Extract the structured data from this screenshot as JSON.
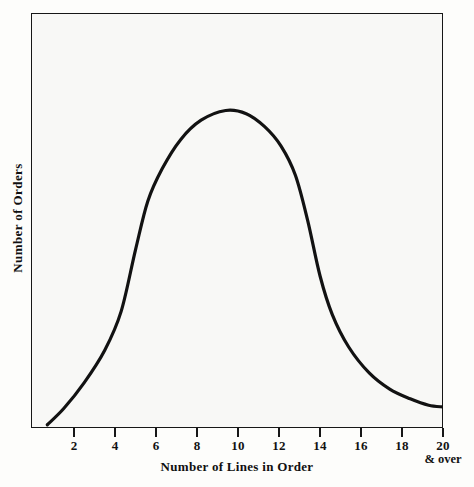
{
  "chart_data": {
    "type": "line",
    "title": "",
    "subtitle": "",
    "xlabel": "Number of Lines in Order",
    "ylabel": "Number of Orders",
    "xlim": [
      0,
      20
    ],
    "ylim": [
      0,
      1
    ],
    "grid": false,
    "legend": null,
    "annotations": [
      {
        "name": "x-axis-over-note",
        "text": "& over",
        "at_x": 20
      }
    ],
    "x_ticks": [
      {
        "value": 2,
        "label": "2"
      },
      {
        "value": 4,
        "label": "4"
      },
      {
        "value": 6,
        "label": "6"
      },
      {
        "value": 8,
        "label": "8"
      },
      {
        "value": 10,
        "label": "10"
      },
      {
        "value": 12,
        "label": "12"
      },
      {
        "value": 14,
        "label": "14"
      },
      {
        "value": 16,
        "label": "16"
      },
      {
        "value": 18,
        "label": "18"
      },
      {
        "value": 20,
        "label": "20"
      }
    ],
    "y_ticks": [],
    "series": [
      {
        "name": "Order line distribution",
        "color": "#121212",
        "line_width": 3,
        "x": [
          0.7,
          1.5,
          2.5,
          3.5,
          4.3,
          5.0,
          5.6,
          6.3,
          7.2,
          8.2,
          9.4,
          10.4,
          11.3,
          12.1,
          12.8,
          13.4,
          14.0,
          14.6,
          15.4,
          16.4,
          17.4,
          18.4,
          19.3,
          20.0
        ],
        "y": [
          0.01,
          0.06,
          0.14,
          0.24,
          0.36,
          0.55,
          0.7,
          0.8,
          0.89,
          0.95,
          0.98,
          0.97,
          0.93,
          0.87,
          0.78,
          0.64,
          0.47,
          0.35,
          0.25,
          0.17,
          0.12,
          0.09,
          0.07,
          0.065
        ]
      }
    ]
  },
  "axes": {
    "x_title": "Number of Lines in Order",
    "y_title": "Number of Orders",
    "x_over_note": "& over"
  },
  "style": {
    "curve_color": "#121212",
    "frame_color": "#171717",
    "background": "#f8f8f6",
    "page_background": "#fdfdfb"
  }
}
